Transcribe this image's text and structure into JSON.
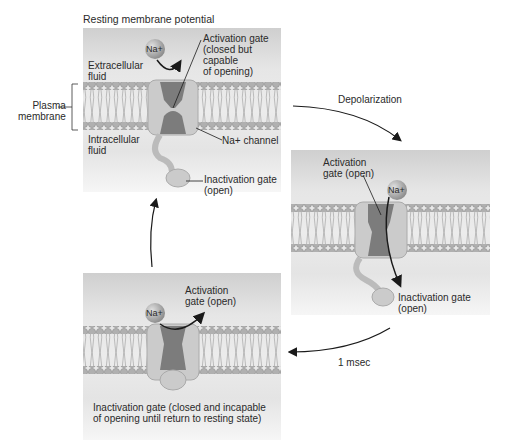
{
  "title": "Resting membrane potential",
  "colors": {
    "membrane_head": "#a8a8a8",
    "channel_light": "#c8c8c8",
    "channel_dark": "#7a7a7a",
    "ion": "#9a9a9a",
    "arrow": "#1a1a1a"
  },
  "left_labels": {
    "plasma_line1": "Plasma",
    "plasma_line2": "membrane"
  },
  "panel1": {
    "extracellular_1": "Extracellular",
    "extracellular_2": "fluid",
    "intracellular_1": "Intracellular",
    "intracellular_2": "fluid",
    "ion": "Na+",
    "activation_1": "Activation gate",
    "activation_2": "(closed but",
    "activation_3": "capable",
    "activation_4": "of opening)",
    "channel": "Na+ channel",
    "inactivation_1": "Inactivation gate",
    "inactivation_2": "(open)"
  },
  "transitions": {
    "depolarization": "Depolarization",
    "time": "1 msec"
  },
  "panel2": {
    "activation_1": "Activation",
    "activation_2": "gate (open)",
    "ion": "Na+",
    "inactivation_1": "Inactivation gate",
    "inactivation_2": "(open)"
  },
  "panel3": {
    "ion": "Na+",
    "activation_1": "Activation",
    "activation_2": "gate (open)",
    "inactivation_1": "Inactivation gate (closed and incapable",
    "inactivation_2": "of opening until return to resting state)"
  }
}
